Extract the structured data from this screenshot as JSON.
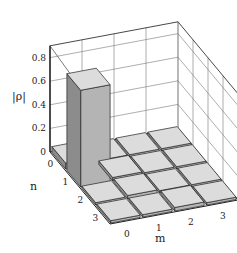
{
  "chart_data": {
    "type": "bar3d",
    "title": "",
    "zlabel": "|ρ|",
    "xlabel": "m",
    "ylabel": "n",
    "m_ticks": [
      "0",
      "1",
      "2",
      "3"
    ],
    "n_ticks": [
      "0",
      "1",
      "2",
      "3"
    ],
    "z_ticks": [
      "0",
      "0.2",
      "0.4",
      "0.6",
      "0.8"
    ],
    "zlim": [
      0,
      0.9
    ],
    "grid": true,
    "values": [
      [
        0.05,
        0.02,
        0.02,
        0.02
      ],
      [
        0.82,
        0.03,
        0.02,
        0.02
      ],
      [
        0.02,
        0.03,
        0.02,
        0.02
      ],
      [
        0.02,
        0.02,
        0.03,
        0.02
      ]
    ],
    "colors": {
      "bar_top": "#dcdcdc",
      "bar_front": "#b4b4b4",
      "bar_side": "#8c8c8c",
      "grid": "#555555"
    }
  }
}
